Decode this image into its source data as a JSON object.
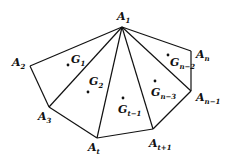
{
  "diagram": {
    "vertices": [
      {
        "id": "A1",
        "base": "A",
        "sub": "1",
        "x": 122,
        "y": 27,
        "lx": 117,
        "ly": 20
      },
      {
        "id": "A2",
        "base": "A",
        "sub": "2",
        "x": 30,
        "y": 66,
        "lx": 12,
        "ly": 66
      },
      {
        "id": "A3",
        "base": "A",
        "sub": "3",
        "x": 49,
        "y": 107,
        "lx": 38,
        "ly": 120
      },
      {
        "id": "At",
        "base": "A",
        "sub": "t",
        "x": 97,
        "y": 138,
        "lx": 88,
        "ly": 151
      },
      {
        "id": "At+1",
        "base": "A",
        "sub": "t+1",
        "x": 153,
        "y": 129,
        "lx": 149,
        "ly": 147
      },
      {
        "id": "An-1",
        "base": "A",
        "sub": "n−1",
        "x": 191,
        "y": 91,
        "lx": 196,
        "ly": 101
      },
      {
        "id": "An",
        "base": "A",
        "sub": "n",
        "x": 191,
        "y": 51,
        "lx": 196,
        "ly": 58
      }
    ],
    "edges": [
      [
        "A1",
        "A2"
      ],
      [
        "A2",
        "A3"
      ],
      [
        "A3",
        "At"
      ],
      [
        "At",
        "At+1"
      ],
      [
        "At+1",
        "An-1"
      ],
      [
        "An-1",
        "An"
      ],
      [
        "An",
        "A1"
      ],
      [
        "A1",
        "A3"
      ],
      [
        "A1",
        "At"
      ],
      [
        "A1",
        "At+1"
      ],
      [
        "A1",
        "An-1"
      ]
    ],
    "centroids": [
      {
        "id": "G1",
        "base": "G",
        "sub": "1",
        "x": 68,
        "y": 65,
        "lx": 71,
        "ly": 63
      },
      {
        "id": "G2",
        "base": "G",
        "sub": "2",
        "x": 88,
        "y": 92,
        "lx": 89,
        "ly": 85
      },
      {
        "id": "Gt-1",
        "base": "G",
        "sub": "t−1",
        "x": 123,
        "y": 98,
        "lx": 118,
        "ly": 113
      },
      {
        "id": "Gn-3",
        "base": "G",
        "sub": "n−3",
        "x": 155,
        "y": 81,
        "lx": 151,
        "ly": 96
      },
      {
        "id": "Gn-2",
        "base": "G",
        "sub": "n−2",
        "x": 168,
        "y": 55,
        "lx": 170,
        "ly": 66
      }
    ],
    "colors": {
      "stroke": "#111111",
      "background": "#ffffff"
    }
  }
}
